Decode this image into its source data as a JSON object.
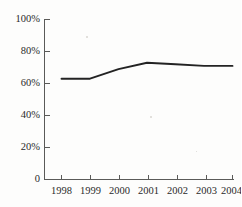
{
  "chart_data": {
    "type": "line",
    "title": "",
    "subtitle": "",
    "xlabel": "",
    "ylabel": "",
    "categories": [
      "1998",
      "1999",
      "2000",
      "2001",
      "2002",
      "2003",
      "2004"
    ],
    "x": [
      1998,
      1999,
      2000,
      2001,
      2002,
      2003,
      2004
    ],
    "series": [
      {
        "name": "",
        "values": [
          63,
          63,
          69,
          73,
          72,
          71,
          71
        ]
      }
    ],
    "values": [
      63,
      63,
      69,
      73,
      72,
      71,
      71
    ],
    "ylim": [
      0,
      100
    ],
    "yticks": [
      0,
      20,
      40,
      60,
      80,
      100
    ],
    "ytick_labels": [
      "0",
      "20%",
      "40%",
      "60%",
      "80%",
      "100%"
    ],
    "xtick_labels": [
      "1998",
      "1999",
      "2000",
      "2001",
      "2002",
      "2003",
      "2004"
    ],
    "grid": false,
    "legend": false,
    "legend_position": "none",
    "line_color": "#232323",
    "axis_color": "#5a5a58",
    "background_color": "#fdfdfc",
    "annotations": []
  }
}
